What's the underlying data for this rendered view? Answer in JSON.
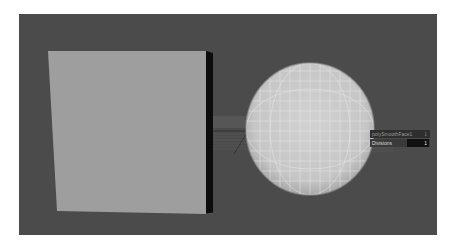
{
  "viewport": {
    "background": "#4b4b4b",
    "objects": [
      {
        "type": "cube",
        "face_color": "#9e9e9e",
        "side_color": "#0c0c0c"
      },
      {
        "type": "sphere",
        "color": "#c9c9c9",
        "grid_color": "#e6e6e6"
      }
    ]
  },
  "hud": {
    "node_name": "polySmoothFace1",
    "node_value": "1",
    "attribute_label": "Divisions",
    "attribute_value": "1"
  }
}
